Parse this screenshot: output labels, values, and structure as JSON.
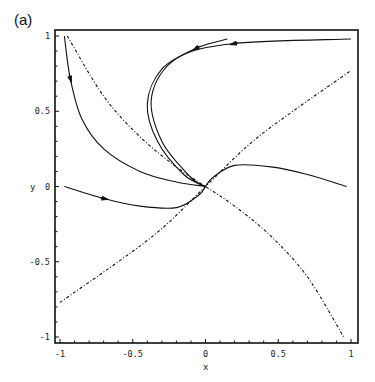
{
  "figure": {
    "panel_label": "(a)",
    "xlabel": "x",
    "ylabel": "y"
  },
  "chart_data": {
    "type": "line",
    "title": "",
    "panel_label": "(a)",
    "xlabel": "x",
    "ylabel": "y",
    "xlim": [
      -1,
      1
    ],
    "ylim": [
      -1,
      1
    ],
    "grid": false,
    "legend": null,
    "x_ticks": [
      -1,
      -0.5,
      0,
      0.5,
      1
    ],
    "x_tick_labels": [
      "-1",
      "-0.5",
      "0",
      "0.5",
      "1"
    ],
    "y_ticks": [
      -1,
      -0.5,
      0,
      0.5,
      1
    ],
    "y_tick_labels": [
      "-1",
      "-0.5",
      "0",
      "0.5",
      "1"
    ],
    "series": [
      {
        "name": "nullcline-1",
        "style": "dash-dot",
        "points": [
          [
            -0.95,
            1.0
          ],
          [
            -0.7,
            0.6
          ],
          [
            -0.45,
            0.33
          ],
          [
            -0.2,
            0.13
          ],
          [
            0,
            0
          ],
          [
            0.2,
            -0.13
          ],
          [
            0.45,
            -0.33
          ],
          [
            0.7,
            -0.6
          ],
          [
            0.95,
            -1.0
          ]
        ]
      },
      {
        "name": "nullcline-2",
        "style": "dash-dot",
        "points": [
          [
            -1.0,
            -0.77
          ],
          [
            -0.6,
            -0.5
          ],
          [
            -0.3,
            -0.28
          ],
          [
            0,
            0
          ],
          [
            0.3,
            0.28
          ],
          [
            0.6,
            0.5
          ],
          [
            1.0,
            0.77
          ]
        ]
      },
      {
        "name": "trajectory-left-top",
        "style": "solid",
        "arrow_at": [
          -0.93,
          0.72
        ],
        "points": [
          [
            -0.97,
            1.0
          ],
          [
            -0.93,
            0.72
          ],
          [
            -0.85,
            0.45
          ],
          [
            -0.7,
            0.25
          ],
          [
            -0.45,
            0.1
          ],
          [
            -0.2,
            0.03
          ],
          [
            0,
            0
          ]
        ]
      },
      {
        "name": "trajectory-left-mid",
        "style": "solid",
        "arrow_at": [
          -0.7,
          -0.08
        ],
        "points": [
          [
            -0.97,
            0.0
          ],
          [
            -0.7,
            -0.08
          ],
          [
            -0.45,
            -0.13
          ],
          [
            -0.2,
            -0.14
          ],
          [
            -0.05,
            -0.06
          ],
          [
            0,
            0
          ]
        ]
      },
      {
        "name": "trajectory-top-inner",
        "style": "solid",
        "arrow_at": [
          -0.06,
          0.92
        ],
        "points": [
          [
            0.15,
            0.98
          ],
          [
            -0.06,
            0.92
          ],
          [
            -0.3,
            0.78
          ],
          [
            -0.4,
            0.55
          ],
          [
            -0.33,
            0.3
          ],
          [
            -0.15,
            0.08
          ],
          [
            0,
            0
          ]
        ]
      },
      {
        "name": "trajectory-top-outer",
        "style": "solid",
        "arrow_at": [
          0.2,
          0.95
        ],
        "points": [
          [
            1.0,
            0.98
          ],
          [
            0.2,
            0.95
          ],
          [
            -0.2,
            0.85
          ],
          [
            -0.37,
            0.6
          ],
          [
            -0.3,
            0.3
          ],
          [
            -0.1,
            0.06
          ],
          [
            0,
            0
          ]
        ]
      },
      {
        "name": "trajectory-right-top",
        "style": "solid",
        "arrow_at": [
          0.7,
          -0.08
        ],
        "points": [
          [
            0.97,
            0.0
          ],
          [
            0.7,
            0.08
          ],
          [
            0.45,
            0.13
          ],
          [
            0.2,
            0.14
          ],
          [
            0.05,
            0.06
          ],
          [
            0,
            0
          ]
        ]
      },
      {
        "name": "trajectory-right-bottom",
        "style": "solid",
        "arrow_at": [
          0.93,
          -0.72
        ],
        "points": [
          [
            0.97,
            -1.0
          ],
          [
            0.93,
            -0.72
          ],
          [
            0.85,
            -0.45
          ],
          [
            0.7,
            -0.25
          ],
          [
            0.45,
            -0.1
          ],
          [
            0.2,
            -0.03
          ],
          [
            0,
            0
          ]
        ]
      },
      {
        "name": "trajectory-bottom-inner",
        "style": "solid",
        "arrow_at": [
          0.06,
          -0.92
        ],
        "points": [
          [
            -0.15,
            -0.98
          ],
          [
            0.06,
            -0.92
          ],
          [
            0.3,
            -0.78
          ],
          [
            0.4,
            -0.55
          ],
          [
            0.33,
            -0.3
          ],
          [
            0.15,
            -0.08
          ],
          [
            0,
            0
          ]
        ]
      },
      {
        "name": "trajectory-bottom-outer",
        "style": "solid",
        "arrow_at": [
          -0.2,
          -0.95
        ],
        "points": [
          [
            -1.0,
            -0.98
          ],
          [
            -0.2,
            -0.95
          ],
          [
            0.2,
            -0.85
          ],
          [
            0.37,
            -0.6
          ],
          [
            0.3,
            -0.3
          ],
          [
            0.1,
            -0.06
          ],
          [
            0,
            0
          ]
        ]
      }
    ]
  }
}
